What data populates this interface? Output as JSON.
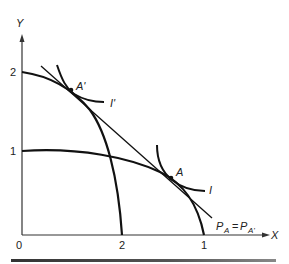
{
  "axes": {
    "x_label": "X",
    "y_label": "Y",
    "origin_label": "0",
    "y_ticks": [
      "2",
      "1"
    ],
    "x_ticks": [
      "2",
      "1"
    ]
  },
  "points": {
    "a_label": "A",
    "a_prime_label": "A'"
  },
  "curves": {
    "indifference_i_label": "I",
    "indifference_i_prime_label": "I'",
    "price_line_label_p": "P",
    "price_line_sub_a": "A",
    "price_line_eq": "=",
    "price_line_sub_a_prime": "A'"
  },
  "colors": {
    "ink": "#1a1a1a"
  }
}
